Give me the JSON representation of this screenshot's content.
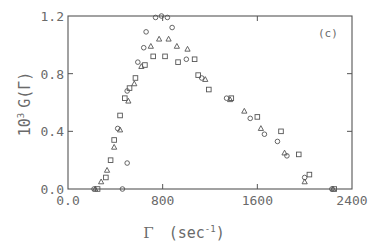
{
  "chart_data": {
    "type": "scatter",
    "title": "",
    "panel_label": "(c)",
    "xlabel": "Γ (sec⁻¹)",
    "xlabel_parts": {
      "symbol": "Γ",
      "open": "(sec",
      "sup": "-1",
      "close": ")"
    },
    "ylabel": "10³ G(Γ)",
    "ylabel_parts": {
      "base": "10",
      "sup": "3",
      "rest": "G(Γ)"
    },
    "xlim": [
      0,
      2400
    ],
    "ylim": [
      0,
      1.2
    ],
    "xticks": [
      0,
      800,
      1600,
      2400
    ],
    "xtick_labels": [
      "0.0",
      "800",
      "1600",
      "2400"
    ],
    "yticks": [
      0.0,
      0.4,
      0.8,
      1.2
    ],
    "ytick_labels": [
      "0.0",
      "0.4",
      "0.8",
      "1.2"
    ],
    "grid": false,
    "legend": "none",
    "series": [
      {
        "name": "circles",
        "marker": "circle",
        "points": [
          [
            220,
            0.0
          ],
          [
            460,
            0.0
          ],
          [
            500,
            0.18
          ],
          [
            420,
            0.42
          ],
          [
            500,
            0.68
          ],
          [
            590,
            0.88
          ],
          [
            640,
            0.98
          ],
          [
            660,
            1.09
          ],
          [
            740,
            1.19
          ],
          [
            790,
            1.2
          ],
          [
            840,
            1.19
          ],
          [
            880,
            1.12
          ],
          [
            1000,
            0.9
          ],
          [
            1130,
            0.77
          ],
          [
            1340,
            0.63
          ],
          [
            1540,
            0.49
          ],
          [
            1660,
            0.38
          ],
          [
            1770,
            0.33
          ],
          [
            1850,
            0.23
          ],
          [
            2000,
            0.08
          ],
          [
            2230,
            0.0
          ]
        ]
      },
      {
        "name": "triangles",
        "marker": "triangle",
        "points": [
          [
            230,
            0.0
          ],
          [
            280,
            0.05
          ],
          [
            330,
            0.13
          ],
          [
            390,
            0.29
          ],
          [
            440,
            0.41
          ],
          [
            510,
            0.61
          ],
          [
            560,
            0.73
          ],
          [
            620,
            0.85
          ],
          [
            700,
            0.99
          ],
          [
            770,
            1.04
          ],
          [
            850,
            1.04
          ],
          [
            920,
            0.99
          ],
          [
            1010,
            0.97
          ],
          [
            1160,
            0.76
          ],
          [
            1370,
            0.62
          ],
          [
            1490,
            0.54
          ],
          [
            1630,
            0.42
          ],
          [
            1830,
            0.25
          ],
          [
            2000,
            0.05
          ],
          [
            2240,
            0.0
          ]
        ]
      },
      {
        "name": "squares",
        "marker": "square",
        "points": [
          [
            250,
            0.0
          ],
          [
            320,
            0.08
          ],
          [
            360,
            0.2
          ],
          [
            390,
            0.34
          ],
          [
            440,
            0.51
          ],
          [
            480,
            0.63
          ],
          [
            520,
            0.7
          ],
          [
            570,
            0.77
          ],
          [
            650,
            0.86
          ],
          [
            720,
            0.92
          ],
          [
            820,
            0.92
          ],
          [
            930,
            0.88
          ],
          [
            1070,
            0.9
          ],
          [
            1100,
            0.79
          ],
          [
            1190,
            0.69
          ],
          [
            1380,
            0.63
          ],
          [
            1600,
            0.5
          ],
          [
            1800,
            0.4
          ],
          [
            1950,
            0.24
          ],
          [
            2040,
            0.1
          ],
          [
            2250,
            0.0
          ]
        ]
      }
    ]
  }
}
